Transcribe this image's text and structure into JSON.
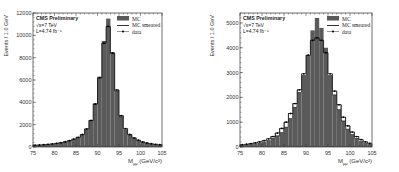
{
  "chart_data": [
    {
      "type": "bar",
      "title": "",
      "annotations": [
        "CMS Preliminary",
        "√s=7 TeV",
        "L=4.74 fb⁻¹"
      ],
      "xlabel": "Mμμ (GeV/c²)",
      "xlabel_main": "M",
      "xlabel_sub": "μμ",
      "xlabel_unit": "(GeV/c²)",
      "ylabel": "Events / 1.0 GeV",
      "xlim": [
        75,
        105
      ],
      "ylim": [
        0,
        12000
      ],
      "xticks": [
        "75",
        "80",
        "85",
        "90",
        "95",
        "100",
        "105"
      ],
      "yticks": [
        "0",
        "2000",
        "4000",
        "6000",
        "8000",
        "10000",
        "12000"
      ],
      "legend": [
        "MC",
        "MC smeared",
        "data"
      ],
      "legend_position": "upper right",
      "grid": false,
      "bin_edges_start": 75,
      "bin_width": 1,
      "series": [
        {
          "name": "MC",
          "values": [
            150,
            170,
            200,
            230,
            270,
            320,
            380,
            460,
            560,
            700,
            850,
            1100,
            1600,
            2400,
            3900,
            6300,
            9500,
            11500,
            8500,
            5000,
            2700,
            1600,
            1100,
            800,
            600,
            450,
            350,
            280,
            230,
            190
          ]
        },
        {
          "name": "MC smeared",
          "values": [
            160,
            180,
            210,
            240,
            280,
            330,
            390,
            470,
            570,
            710,
            870,
            1120,
            1620,
            2380,
            3850,
            6200,
            9300,
            10800,
            8400,
            5100,
            2800,
            1650,
            1120,
            820,
            610,
            460,
            360,
            290,
            240,
            200
          ]
        },
        {
          "name": "data",
          "values": [
            160,
            180,
            210,
            240,
            280,
            330,
            390,
            470,
            570,
            710,
            870,
            1120,
            1620,
            2380,
            3850,
            6200,
            9300,
            10800,
            8400,
            5100,
            2800,
            1650,
            1120,
            820,
            610,
            460,
            360,
            290,
            240,
            200
          ]
        }
      ]
    },
    {
      "type": "bar",
      "title": "",
      "annotations": [
        "CMS Preliminary",
        "√s=7 TeV",
        "L=4.74 fb⁻¹"
      ],
      "xlabel": "Mμμ (GeV/c²)",
      "xlabel_main": "M",
      "xlabel_sub": "μμ",
      "xlabel_unit": "(GeV/c²)",
      "ylabel": "Events / 1.0 GeV",
      "xlim": [
        75,
        105
      ],
      "ylim": [
        0,
        5400
      ],
      "xticks": [
        "75",
        "80",
        "85",
        "90",
        "95",
        "100",
        "105"
      ],
      "yticks": [
        "0",
        "1000",
        "2000",
        "3000",
        "4000",
        "5000"
      ],
      "legend": [
        "MC",
        "MC smeared",
        "data"
      ],
      "legend_position": "upper right",
      "grid": false,
      "bin_edges_start": 75,
      "bin_width": 1,
      "series": [
        {
          "name": "MC",
          "values": [
            80,
            100,
            120,
            150,
            180,
            220,
            280,
            350,
            450,
            580,
            800,
            1150,
            1600,
            2200,
            2900,
            3700,
            4700,
            5200,
            4800,
            4000,
            2900,
            2100,
            1500,
            1050,
            720,
            500,
            350,
            250,
            180,
            130
          ]
        },
        {
          "name": "MC smeared",
          "values": [
            90,
            110,
            140,
            170,
            210,
            260,
            330,
            420,
            560,
            750,
            1000,
            1350,
            1750,
            2300,
            2950,
            3700,
            4300,
            4400,
            4300,
            3800,
            2950,
            2250,
            1700,
            1200,
            850,
            600,
            420,
            300,
            210,
            150
          ]
        },
        {
          "name": "data",
          "values": [
            90,
            110,
            140,
            170,
            210,
            260,
            330,
            420,
            560,
            750,
            1000,
            1350,
            1750,
            2300,
            2950,
            3700,
            4300,
            4400,
            4300,
            3800,
            2950,
            2250,
            1700,
            1200,
            850,
            600,
            420,
            300,
            210,
            150
          ]
        }
      ]
    }
  ],
  "colors": {
    "mc_fill": "#5a5a5a",
    "smeared_line": "#000000",
    "data_marker": "#000000",
    "axis": "#333333"
  }
}
